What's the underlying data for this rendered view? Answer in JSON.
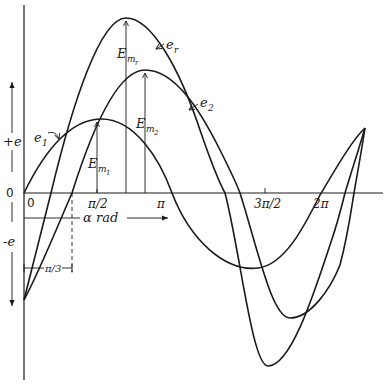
{
  "diagram": {
    "axis": {
      "y_positive_label": "+e",
      "y_negative_label": "-e",
      "origin_y_label": "0",
      "origin_x_label": "0",
      "x_label": "α rad",
      "x_ticks": [
        "π/2",
        "π",
        "3π/2",
        "2π"
      ]
    },
    "phase_shift_label": "π/3",
    "curves": {
      "e1": {
        "label": "e",
        "sub": "1"
      },
      "e2": {
        "label": "e",
        "sub": "2"
      },
      "er": {
        "label": "e",
        "sub": "r"
      }
    },
    "amplitudes": {
      "em1": {
        "label": "E",
        "sub": "m",
        "subsub": "1"
      },
      "em2": {
        "label": "E",
        "sub": "m",
        "subsub": "2"
      },
      "emr": {
        "label": "E",
        "sub": "m",
        "subsub": "r"
      }
    }
  }
}
